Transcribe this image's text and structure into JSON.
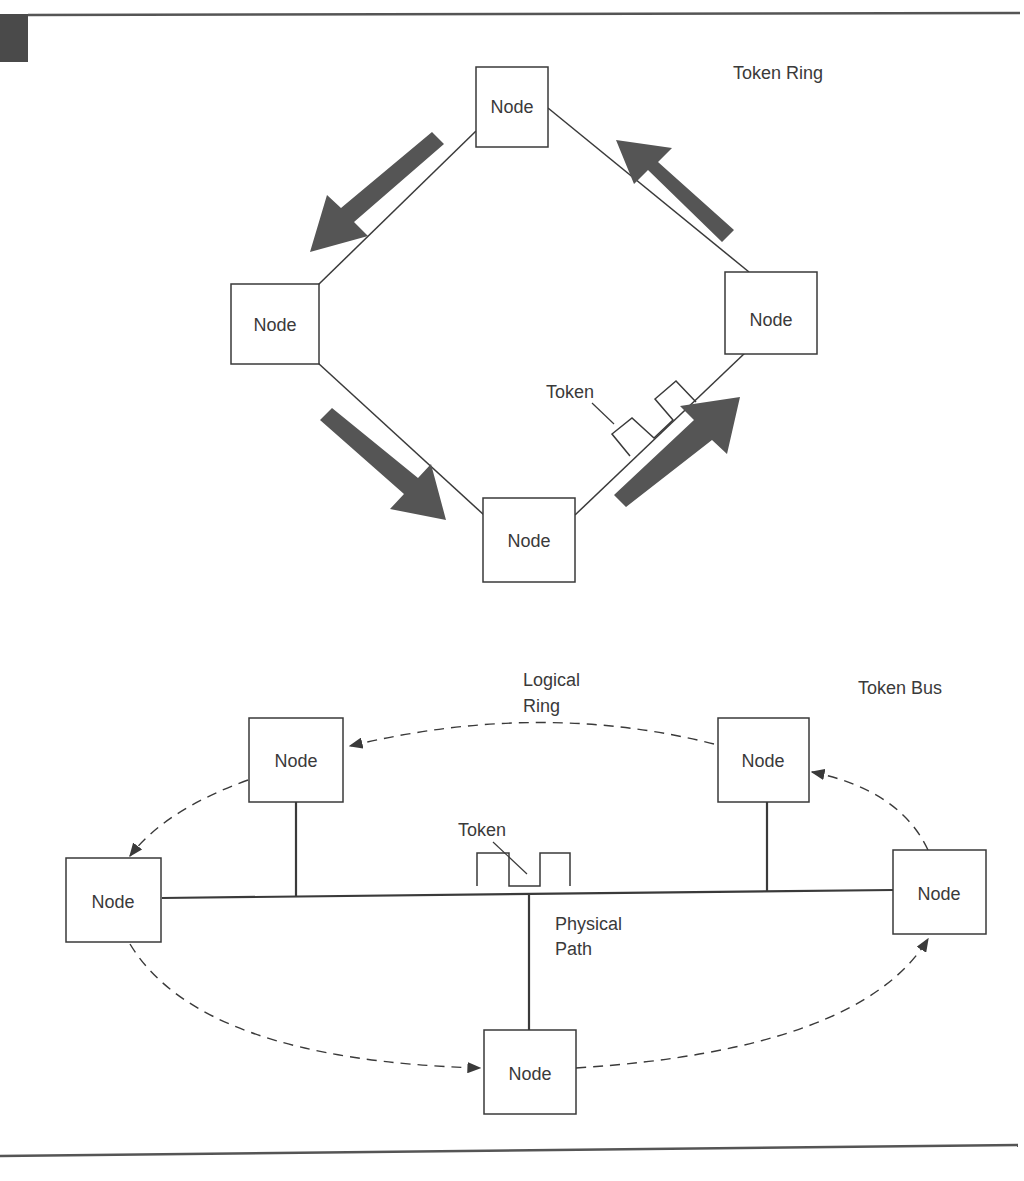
{
  "colors": {
    "line": "#3a3a3a",
    "arrow": "#555555",
    "tab": "#4a4a4a",
    "node_fill": "#ffffff"
  },
  "token_ring": {
    "title": "Token Ring",
    "token_label": "Token",
    "nodes": [
      {
        "id": "top",
        "label": "Node"
      },
      {
        "id": "left",
        "label": "Node"
      },
      {
        "id": "right",
        "label": "Node"
      },
      {
        "id": "bottom",
        "label": "Node"
      }
    ],
    "flow_direction": "counter-clockwise"
  },
  "token_bus": {
    "title": "Token Bus",
    "logical_ring_label_line1": "Logical",
    "logical_ring_label_line2": "Ring",
    "token_label": "Token",
    "physical_path_line1": "Physical",
    "physical_path_line2": "Path",
    "nodes": [
      {
        "id": "upper-left",
        "label": "Node"
      },
      {
        "id": "upper-right",
        "label": "Node"
      },
      {
        "id": "left",
        "label": "Node"
      },
      {
        "id": "right",
        "label": "Node"
      },
      {
        "id": "bottom",
        "label": "Node"
      }
    ]
  }
}
